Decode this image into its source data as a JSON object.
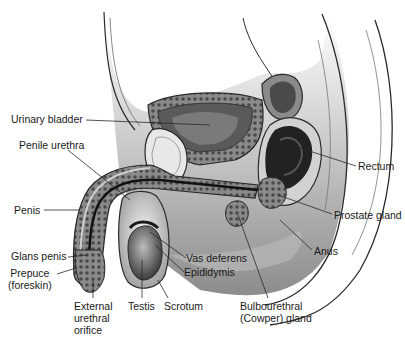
{
  "diagram": {
    "labels": [
      {
        "id": "urinary-bladder",
        "text": "Urinary bladder",
        "x": 11,
        "y": 113
      },
      {
        "id": "penile-urethra",
        "text": "Penile urethra",
        "x": 19,
        "y": 139
      },
      {
        "id": "penis",
        "text": "Penis",
        "x": 14,
        "y": 204
      },
      {
        "id": "glans-penis",
        "text": "Glans penis",
        "x": 11,
        "y": 250
      },
      {
        "id": "prepuce",
        "text": "Prepuce\n(foreskin)",
        "x": 8,
        "y": 267
      },
      {
        "id": "external-urethral-orifice",
        "text": "External\nurethral\norifice",
        "x": 74,
        "y": 300
      },
      {
        "id": "testis",
        "text": "Testis",
        "x": 128,
        "y": 300
      },
      {
        "id": "scrotum",
        "text": "Scrotum",
        "x": 164,
        "y": 300
      },
      {
        "id": "vas-deferens",
        "text": "Vas deferens",
        "x": 186,
        "y": 252
      },
      {
        "id": "epididymis",
        "text": "Epididymis",
        "x": 184,
        "y": 266
      },
      {
        "id": "bulbourethral-gland",
        "text": "Bulbourethral\n(Cowper) gland",
        "x": 240,
        "y": 300
      },
      {
        "id": "anus",
        "text": "Anus",
        "x": 314,
        "y": 245
      },
      {
        "id": "prostate-gland",
        "text": "Prostate gland",
        "x": 334,
        "y": 209
      },
      {
        "id": "rectum",
        "text": "Rectum",
        "x": 358,
        "y": 160
      }
    ]
  },
  "colors": {
    "background": "#ffffff",
    "tissue_light": "#d9d9d9",
    "tissue_mid": "#9a9a9a",
    "tissue_dark": "#3a3a3a",
    "outline": "#2a2a2a",
    "label_text": "#1a1a1a"
  }
}
